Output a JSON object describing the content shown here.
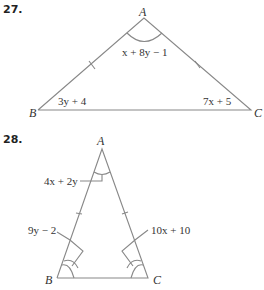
{
  "problems": [
    {
      "number": "27.",
      "vertices": {
        "A": "A",
        "B": "B",
        "C": "C"
      },
      "angle_labels": {
        "A": "x + 8y − 1",
        "B": "3y + 4",
        "C": "7x + 5"
      },
      "congruent_sides": [
        "AB",
        "AC"
      ]
    },
    {
      "number": "28.",
      "vertices": {
        "A": "A",
        "B": "B",
        "C": "C"
      },
      "angle_labels": {
        "A": "4x + 2y",
        "B": "9y − 2",
        "C": "10x + 10"
      },
      "congruent_sides": [
        "AB",
        "AC"
      ]
    }
  ]
}
